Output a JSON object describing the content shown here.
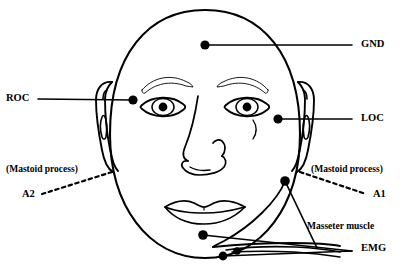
{
  "figure": {
    "type": "anatomical-diagram",
    "background_color": "#ffffff",
    "line_color": "#000000"
  },
  "labels": {
    "gnd": "GND",
    "roc": "ROC",
    "loc": "LOC",
    "a1": "A1",
    "a2": "A2",
    "mastoid_left": "(Mastoid process)",
    "mastoid_right": "(Mastoid process)",
    "masseter": "Masseter muscle",
    "emg": "EMG"
  },
  "electrodes": [
    {
      "name": "GND",
      "label": "GND",
      "x": 205,
      "y": 45,
      "leader": "solid",
      "label_x": 361,
      "label_y": 45
    },
    {
      "name": "ROC",
      "label": "ROC",
      "x": 133,
      "y": 100,
      "leader": "solid",
      "label_x": 8,
      "label_y": 99
    },
    {
      "name": "LOC",
      "label": "LOC",
      "x": 278,
      "y": 119,
      "leader": "solid",
      "label_x": 361,
      "label_y": 119
    },
    {
      "name": "A2",
      "label": "A2",
      "x": 112,
      "y": 172,
      "leader": "dotted",
      "label_x": 22,
      "label_y": 196
    },
    {
      "name": "A1",
      "label": "A1",
      "x": 300,
      "y": 172,
      "leader": "dotted",
      "label_x": 373,
      "label_y": 196
    },
    {
      "name": "EMG-upper",
      "label": "EMG",
      "x": 285,
      "y": 181,
      "leader": "solid",
      "label_x": 361,
      "label_y": 249
    },
    {
      "name": "EMG-submental",
      "label": "EMG",
      "x": 203,
      "y": 235,
      "leader": "solid",
      "label_x": 361,
      "label_y": 249
    },
    {
      "name": "EMG-chin",
      "label": "EMG",
      "x": 223,
      "y": 256,
      "leader": "solid",
      "label_x": 361,
      "label_y": 249
    }
  ],
  "annotations": [
    {
      "name": "mastoid-left",
      "text": "(Mastoid process)",
      "x": 8,
      "y": 172
    },
    {
      "name": "mastoid-right",
      "text": "(Mastoid process)",
      "x": 311,
      "y": 172
    },
    {
      "name": "masseter",
      "text": "Masseter muscle",
      "x": 307,
      "y": 228
    }
  ]
}
